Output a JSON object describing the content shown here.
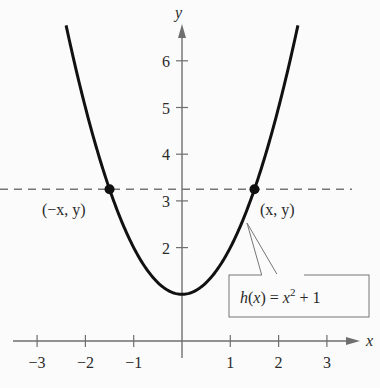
{
  "chart_data": {
    "type": "line",
    "title": "",
    "function_label": "h(x) = x² + 1",
    "function_label_parts": {
      "lhs": "h(x) = x",
      "exp": "2",
      "rhs": " + 1"
    },
    "xlabel": "x",
    "ylabel": "y",
    "xlim": [
      -3.7,
      4
    ],
    "ylim": [
      -0.8,
      6.8
    ],
    "x_ticks": [
      -3,
      -2,
      -1,
      1,
      2,
      3
    ],
    "x_tick_labels": [
      "−3",
      "−2",
      "−1",
      "1",
      "2",
      "3"
    ],
    "y_ticks": [
      2,
      3,
      4,
      5,
      6
    ],
    "y_tick_labels": [
      "2",
      "3",
      "4",
      "5",
      "6"
    ],
    "grid": false,
    "series": [
      {
        "name": "h(x) = x^2 + 1",
        "expression": "x^2 + 1",
        "x_range": [
          -2.4,
          2.4
        ]
      }
    ],
    "reference_line": {
      "type": "horizontal",
      "y": 3.25,
      "style": "dashed"
    },
    "points": [
      {
        "x": -1.5,
        "y": 3.25,
        "label": "(−x, y)"
      },
      {
        "x": 1.5,
        "y": 3.25,
        "label": "(x, y)"
      }
    ],
    "annotations": [
      "(−x, y)",
      "(x, y)",
      "h(x) = x² + 1"
    ]
  }
}
